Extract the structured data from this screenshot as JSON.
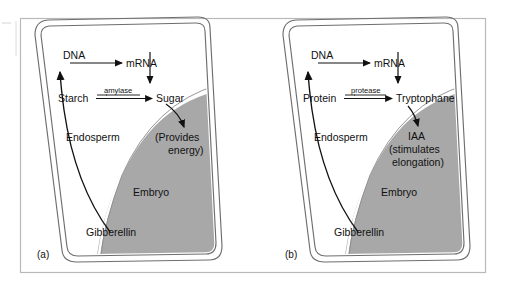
{
  "figure": {
    "type": "biology-diagram",
    "background_color": "#ffffff",
    "frame_color": "#b9b9b9",
    "embryo_fill": "#a8a8a8",
    "seed_wall_color": "#6e6e6e",
    "line_color": "#111111"
  },
  "panels": [
    {
      "id": "a",
      "caption": "(a)",
      "nodes": {
        "dna": "DNA",
        "mrna": "mRNA",
        "substrate": "Starch",
        "enzyme": "amylase",
        "product": "Sugar",
        "effect_line1": "(Provides",
        "effect_line2": "energy)",
        "endosperm": "Endosperm",
        "embryo": "Embryo",
        "hormone": "Gibberellin"
      }
    },
    {
      "id": "b",
      "caption": "(b)",
      "nodes": {
        "dna": "DNA",
        "mrna": "mRNA",
        "substrate": "Protein",
        "enzyme": "protease",
        "product": "Tryptophane",
        "effect_line0": "IAA",
        "effect_line1": "(stimulates",
        "effect_line2": "elongation)",
        "endosperm": "Endosperm",
        "embryo": "Embryo",
        "hormone": "Gibberellin"
      }
    }
  ]
}
